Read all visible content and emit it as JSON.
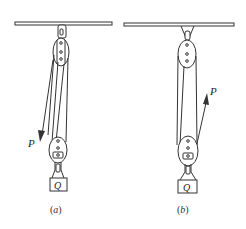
{
  "diagram": {
    "figures": [
      {
        "id": "a",
        "caption": "(a)",
        "caption_letter": "a",
        "force_label": "P",
        "load_label": "Q",
        "force_direction": "downward"
      },
      {
        "id": "b",
        "caption": "(b)",
        "caption_letter": "b",
        "force_label": "P",
        "load_label": "Q",
        "force_direction": "upward"
      }
    ],
    "colors": {
      "stroke": "#333333",
      "background": "#ffffff"
    }
  }
}
